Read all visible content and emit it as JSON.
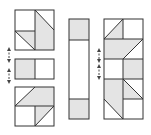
{
  "diagram": {
    "colors": {
      "stroke": "#333333",
      "shade": "#e4e4e4",
      "background": "#ffffff",
      "arrow": "#444444"
    },
    "figures": [
      {
        "name": "left-figure",
        "pieces": 3
      },
      {
        "name": "middle-strip",
        "pieces": 1
      },
      {
        "name": "right-figure",
        "pieces": 5
      }
    ],
    "arrows": [
      {
        "name": "swap-arrow-left-1",
        "style": "dashed double-headed"
      },
      {
        "name": "swap-arrow-left-2",
        "style": "dashed double-headed"
      },
      {
        "name": "swap-arrow-right-1",
        "style": "dashed double-headed"
      },
      {
        "name": "swap-arrow-right-2",
        "style": "dashed double-headed"
      }
    ]
  }
}
